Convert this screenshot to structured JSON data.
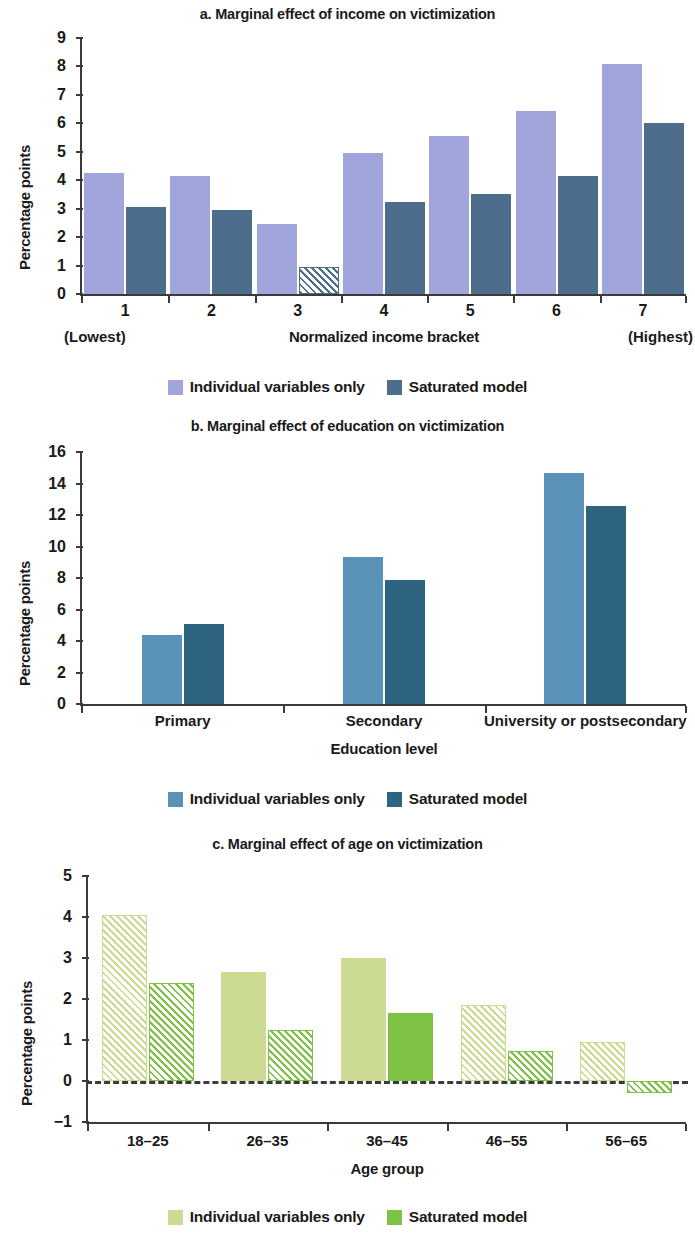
{
  "figure": {
    "legend_labels": {
      "series1": "Individual variables only",
      "series2": "Saturated model"
    }
  },
  "panels": {
    "a": {
      "title": "a. Marginal effect of income on victimization",
      "ylabel": "Percentage points",
      "xlabel": "Normalized income bracket",
      "left_note": "(Lowest)",
      "right_note": "(Highest)",
      "legend": {
        "series1": "Individual variables only",
        "series2": "Saturated model"
      }
    },
    "b": {
      "title": "b. Marginal effect of education on victimization",
      "ylabel": "Percentage points",
      "xlabel": "Education level",
      "legend": {
        "series1": "Individual variables only",
        "series2": "Saturated model"
      }
    },
    "c": {
      "title": "c. Marginal effect of age on victimization",
      "ylabel": "Percentage points",
      "xlabel": "Age group",
      "legend": {
        "series1": "Individual variables only",
        "series2": "Saturated model"
      }
    }
  },
  "chart_data": [
    {
      "id": "a",
      "type": "bar",
      "title": "a. Marginal effect of income on victimization",
      "xlabel": "Normalized income bracket",
      "ylabel": "Percentage points",
      "categories": [
        "1",
        "2",
        "3",
        "4",
        "5",
        "6",
        "7"
      ],
      "category_notes": {
        "first": "(Lowest)",
        "last": "(Highest)"
      },
      "yticks": [
        0,
        1,
        2,
        3,
        4,
        5,
        6,
        7,
        8,
        9
      ],
      "ylim": [
        0,
        9
      ],
      "grid": false,
      "legend_position": "bottom",
      "colors": {
        "series1": "#a0a5dc",
        "series2": "#4c6d8c"
      },
      "series": [
        {
          "name": "Individual variables only",
          "color": "#a0a5dc",
          "values": [
            4.25,
            4.15,
            2.45,
            4.95,
            5.55,
            6.45,
            8.1
          ],
          "hatched": [
            false,
            false,
            false,
            false,
            false,
            false,
            false
          ]
        },
        {
          "name": "Saturated model",
          "color": "#4c6d8c",
          "values": [
            3.05,
            2.95,
            0.95,
            3.25,
            3.5,
            4.15,
            6.0
          ],
          "hatched": [
            false,
            false,
            true,
            false,
            false,
            false,
            false
          ]
        }
      ]
    },
    {
      "id": "b",
      "type": "bar",
      "title": "b. Marginal effect of education on victimization",
      "xlabel": "Education level",
      "ylabel": "Percentage points",
      "categories": [
        "Primary",
        "Secondary",
        "University or postsecondary"
      ],
      "yticks": [
        0,
        2,
        4,
        6,
        8,
        10,
        12,
        14,
        16
      ],
      "ylim": [
        0,
        16
      ],
      "grid": false,
      "legend_position": "bottom",
      "colors": {
        "series1": "#5b92b8",
        "series2": "#2e6480"
      },
      "series": [
        {
          "name": "Individual variables only",
          "color": "#5b92b8",
          "values": [
            4.4,
            9.35,
            14.65
          ],
          "hatched": [
            false,
            false,
            false
          ]
        },
        {
          "name": "Saturated model",
          "color": "#2e6480",
          "values": [
            5.05,
            7.9,
            12.55
          ],
          "hatched": [
            false,
            false,
            false
          ]
        }
      ]
    },
    {
      "id": "c",
      "type": "bar",
      "title": "c. Marginal effect of age on victimization",
      "xlabel": "Age group",
      "ylabel": "Percentage points",
      "categories": [
        "18–25",
        "26–35",
        "36–45",
        "46–55",
        "56–65"
      ],
      "yticks": [
        -1,
        0,
        1,
        2,
        3,
        4,
        5
      ],
      "ytick_labels": [
        "−1",
        "0",
        "1",
        "2",
        "3",
        "4",
        "5"
      ],
      "ylim": [
        -1,
        5
      ],
      "grid": false,
      "zero_line": "dashed",
      "legend_position": "bottom",
      "colors": {
        "series1": "#cbdc92",
        "series2": "#7dc242"
      },
      "series": [
        {
          "name": "Individual variables only",
          "color": "#cbdc92",
          "values": [
            4.05,
            2.67,
            3.0,
            1.85,
            0.95
          ],
          "hatched": [
            true,
            false,
            false,
            true,
            true
          ]
        },
        {
          "name": "Saturated model",
          "color": "#7dc242",
          "values": [
            2.4,
            1.25,
            1.65,
            0.72,
            -0.3
          ],
          "hatched": [
            true,
            true,
            false,
            true,
            true
          ]
        }
      ]
    }
  ]
}
